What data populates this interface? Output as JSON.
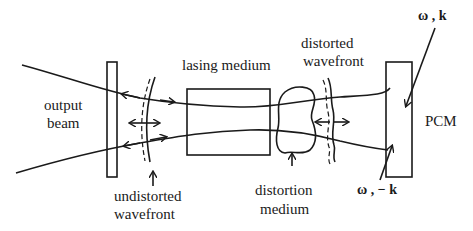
{
  "diagram": {
    "type": "optical phase-conjugation laser resonator schematic",
    "labels": {
      "output_beam_line1": "output",
      "output_beam_line2": "beam",
      "lasing_medium": "lasing medium",
      "distorted_wavefront_line1": "distorted",
      "distorted_wavefront_line2": "wavefront",
      "undistorted_wavefront_line1": "undistorted",
      "undistorted_wavefront_line2": "wavefront",
      "distortion_medium_line1": "distortion",
      "distortion_medium_line2": "medium",
      "pcm": "PCM",
      "incident_wave": "ω , k",
      "conjugate_wave": "ω , − k"
    },
    "components": [
      {
        "name": "output-coupler-mirror"
      },
      {
        "name": "undistorted-wavefront"
      },
      {
        "name": "lasing-medium"
      },
      {
        "name": "distortion-medium"
      },
      {
        "name": "distorted-wavefront"
      },
      {
        "name": "phase-conjugate-mirror"
      }
    ],
    "colors": {
      "ink": "#1a1a1a",
      "background": "#ffffff"
    }
  }
}
